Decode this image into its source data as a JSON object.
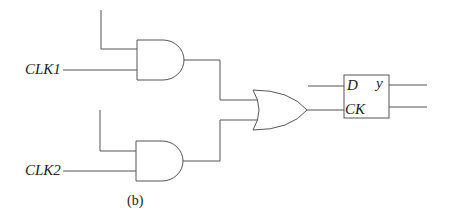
{
  "diagram": {
    "inputs": [
      {
        "label": "CLK1"
      },
      {
        "label": "CLK2"
      }
    ],
    "gates": [
      {
        "type": "AND",
        "name": "and-gate-1"
      },
      {
        "type": "AND",
        "name": "and-gate-2"
      },
      {
        "type": "OR",
        "name": "or-gate"
      }
    ],
    "flip_flop": {
      "type": "D flip-flop",
      "pin_d": "D",
      "pin_ck": "CK",
      "pin_y": "y"
    },
    "caption": "(b)",
    "colors": {
      "line": "#555555",
      "text": "#222222",
      "background": "#ffffff"
    }
  }
}
